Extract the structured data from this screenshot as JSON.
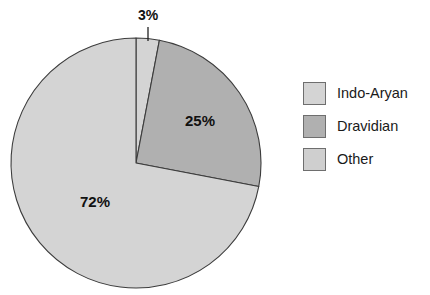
{
  "chart_data": {
    "type": "pie",
    "title": "",
    "subtitle": "",
    "xlabel": "",
    "ylabel": "",
    "grid": false,
    "legend_position": "right",
    "start_angle_deg": 0,
    "direction": "clockwise",
    "categories": [
      "Indo-Aryan",
      "Dravidian",
      "Other"
    ],
    "values": [
      72,
      25,
      3
    ],
    "unit": "%",
    "data_labels": [
      "72%",
      "25%",
      "3%"
    ],
    "colors": [
      "#d4d4d4",
      "#b0b0b0",
      "#d4d4d4"
    ],
    "slices": [
      {
        "name": "Other",
        "value": 3,
        "label": "3%",
        "color": "#d4d4d4",
        "label_x": 148,
        "label_y": 16,
        "label_size": "small",
        "leader": {
          "x1": 148,
          "y1": 27,
          "x2": 148,
          "y2": 41
        }
      },
      {
        "name": "Dravidian",
        "value": 25,
        "label": "25%",
        "color": "#b0b0b0",
        "label_x": 200,
        "label_y": 122,
        "label_size": "normal"
      },
      {
        "name": "Indo-Aryan",
        "value": 72,
        "label": "72%",
        "color": "#d4d4d4",
        "label_x": 95,
        "label_y": 203,
        "label_size": "normal"
      }
    ],
    "geometry": {
      "cx": 136,
      "cy": 163,
      "r": 125
    }
  },
  "legend": {
    "items": [
      {
        "label": "Indo-Aryan",
        "color": "#d4d4d4"
      },
      {
        "label": "Dravidian",
        "color": "#b0b0b0"
      },
      {
        "label": "Other",
        "color": "#cfcfcf"
      }
    ]
  }
}
